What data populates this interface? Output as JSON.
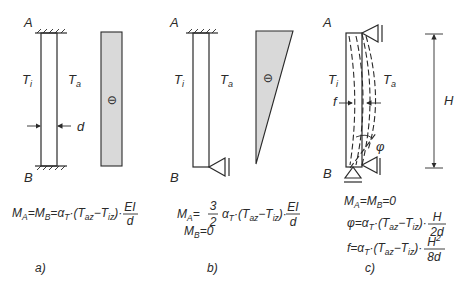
{
  "figure": {
    "panel_a": {
      "caption": "a)",
      "node_top": "A",
      "node_bottom": "B",
      "inner_temp": "T",
      "inner_temp_sub": "i",
      "outer_temp": "T",
      "outer_temp_sub": "a",
      "thickness_label": "d",
      "moment_sign": "⊖",
      "formula": {
        "lhs1": "M",
        "lhs1_sub": "A",
        "lhs2": "M",
        "lhs2_sub": "B",
        "alpha": "α",
        "alpha_sub": "T",
        "paren_open": "·(T",
        "taz_sub": "az",
        "minus": "−T",
        "tiz_sub": "iz",
        "paren_close": ")·",
        "frac_num": "EI",
        "frac_den": "d"
      }
    },
    "panel_b": {
      "caption": "b)",
      "node_top": "A",
      "node_bottom": "B",
      "inner_temp": "T",
      "inner_temp_sub": "i",
      "outer_temp": "T",
      "outer_temp_sub": "a",
      "moment_sign": "⊖",
      "formula": {
        "lhs": "M",
        "lhs_sub": "A",
        "coef_num": "3",
        "coef_den": "2",
        "alpha": "α",
        "alpha_sub": "T",
        "paren_open": "·(T",
        "taz_sub": "az",
        "minus": "−T",
        "tiz_sub": "iz",
        "paren_close": ")·",
        "frac_num": "EI",
        "frac_den": "d",
        "line2_lhs": "M",
        "line2_lhs_sub": "B",
        "line2_rhs": "=0"
      }
    },
    "panel_c": {
      "caption": "c)",
      "node_top": "A",
      "node_bottom": "B",
      "inner_temp": "T",
      "inner_temp_sub": "i",
      "outer_temp": "T",
      "outer_temp_sub": "a",
      "deflection_label": "f",
      "rotation_label": "φ",
      "height_label": "H",
      "formula": {
        "line1": {
          "m1": "M",
          "m1_sub": "A",
          "m2": "M",
          "m2_sub": "B",
          "rhs": "=0"
        },
        "line2": {
          "lhs": "φ=α",
          "alpha_sub": "T",
          "mid": "·(T",
          "taz_sub": "az",
          "minus": "−T",
          "tiz_sub": "iz",
          "close": ")·",
          "frac_num": "H",
          "frac_den": "2d"
        },
        "line3": {
          "lhs": "f=α",
          "alpha_sub": "T",
          "mid": "·(T",
          "taz_sub": "az",
          "minus": "−T",
          "tiz_sub": "iz",
          "close": ")·",
          "frac_num": "H",
          "frac_num_sup": "2",
          "frac_den": "8d"
        }
      }
    },
    "colors": {
      "line": "#2a2a2a",
      "moment_fill": "#d9d9d9"
    }
  }
}
